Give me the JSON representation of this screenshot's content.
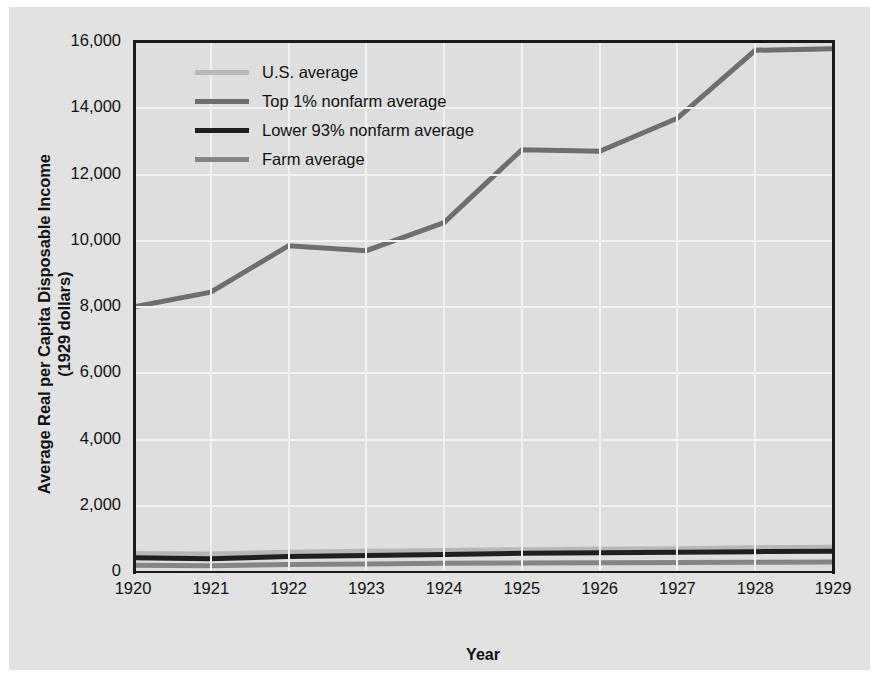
{
  "chart_data": {
    "type": "line",
    "title": "",
    "xlabel": "Year",
    "ylabel": "Average Real per Capita Disposable Income (1929 dollars)",
    "ylabel_line1": "Average Real per Capita Disposable Income",
    "ylabel_line2": "(1929 dollars)",
    "x": [
      1920,
      1921,
      1922,
      1923,
      1924,
      1925,
      1926,
      1927,
      1928,
      1929
    ],
    "categories": [
      "1920",
      "1921",
      "1922",
      "1923",
      "1924",
      "1925",
      "1926",
      "1927",
      "1928",
      "1929"
    ],
    "xlim": [
      1920,
      1929
    ],
    "ylim": [
      0,
      16000
    ],
    "yticks": [
      0,
      2000,
      4000,
      6000,
      8000,
      10000,
      12000,
      14000,
      16000
    ],
    "ytick_labels": [
      "0",
      "2,000",
      "4,000",
      "6,000",
      "8,000",
      "10,000",
      "12,000",
      "14,000",
      "16,000"
    ],
    "grid": true,
    "legend_position": "upper left",
    "series": [
      {
        "name": "U.S. average",
        "color": "#b7b7b7",
        "width": 5,
        "values": [
          560,
          545,
          600,
          625,
          650,
          675,
          690,
          705,
          730,
          745
        ]
      },
      {
        "name": "Top 1% nonfarm average",
        "color": "#6e6e6e",
        "width": 5,
        "values": [
          8000,
          8450,
          9850,
          9700,
          10550,
          12750,
          12700,
          13700,
          15750,
          15800
        ]
      },
      {
        "name": "Lower 93% nonfarm average",
        "color": "#1f1f1f",
        "width": 5,
        "values": [
          430,
          400,
          470,
          500,
          530,
          565,
          580,
          595,
          615,
          625
        ]
      },
      {
        "name": "Farm average",
        "color": "#858585",
        "width": 5,
        "values": [
          205,
          185,
          230,
          245,
          265,
          275,
          280,
          285,
          295,
          300
        ]
      }
    ]
  },
  "legend": {
    "items": [
      {
        "label": "U.S. average",
        "color": "#b7b7b7"
      },
      {
        "label": "Top 1% nonfarm average",
        "color": "#6e6e6e"
      },
      {
        "label": "Lower 93% nonfarm average",
        "color": "#1f1f1f"
      },
      {
        "label": "Farm average",
        "color": "#858585"
      }
    ]
  }
}
